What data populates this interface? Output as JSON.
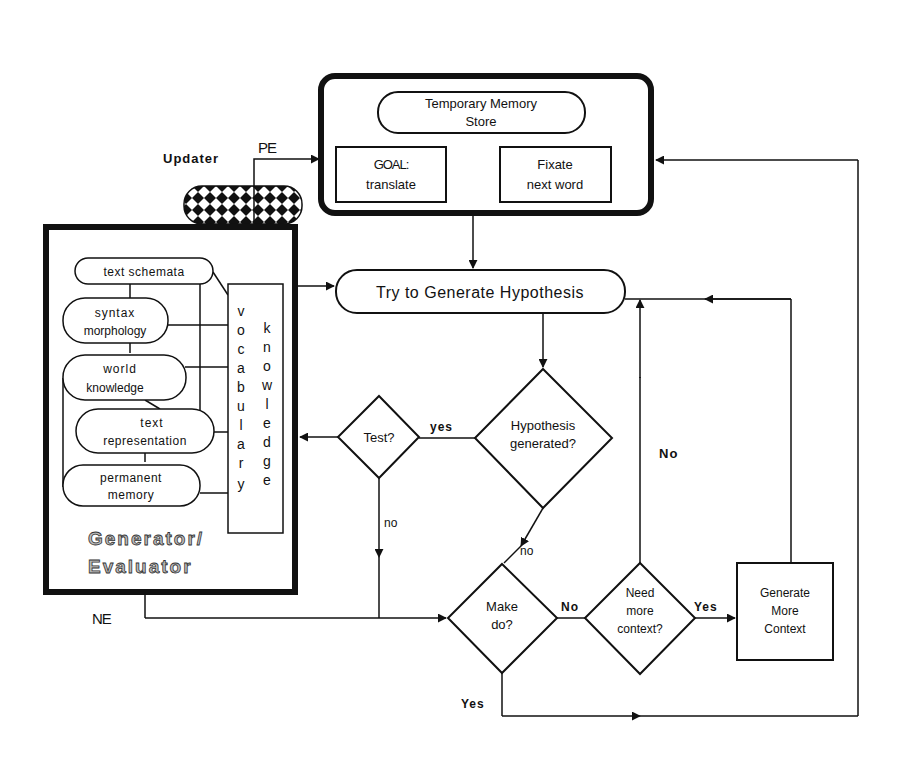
{
  "diagram": {
    "title": "Task Representation",
    "task_representation": {
      "temporary_memory_line1": "Temporary Memory",
      "temporary_memory_line2": "Store",
      "goal_line1": "GOAL:",
      "goal_line2": "translate",
      "fixate_line1": "Fixate",
      "fixate_line2": "next word"
    },
    "updater_label": "Updater",
    "pe_label": "PE",
    "ne_label": "NE",
    "generator_evaluator": {
      "label_line1": "Generator/",
      "label_line2": "Evaluator",
      "modules": [
        {
          "line1": "text schemata",
          "line2": ""
        },
        {
          "line1": "syntax",
          "line2": "morphology"
        },
        {
          "line1": "world",
          "line2": "knowledge"
        },
        {
          "line1": "text",
          "line2": "representation"
        },
        {
          "line1": "permanent",
          "line2": "memory"
        }
      ],
      "vocabulary": [
        "v",
        "o",
        "c",
        "a",
        "b",
        "u",
        "l",
        "a",
        "r",
        "y"
      ],
      "knowledge": [
        "k",
        "n",
        "o",
        "w",
        "l",
        "e",
        "d",
        "g",
        "e"
      ]
    },
    "nodes": {
      "try_generate": "Try to Generate Hypothesis",
      "hypothesis_line1": "Hypothesis",
      "hypothesis_line2": "generated?",
      "test": "Test?",
      "make_do_line1": "Make",
      "make_do_line2": "do?",
      "need_line1": "Need",
      "need_line2": "more",
      "need_line3": "context?",
      "gen_more_line1": "Generate",
      "gen_more_line2": "More",
      "gen_more_line3": "Context"
    },
    "edge_labels": {
      "test_yes": "yes",
      "test_no": "no",
      "hyp_no": "no",
      "makedo_no": "No",
      "makedo_yes": "Yes",
      "need_yes": "Yes",
      "need_no": "No"
    }
  }
}
